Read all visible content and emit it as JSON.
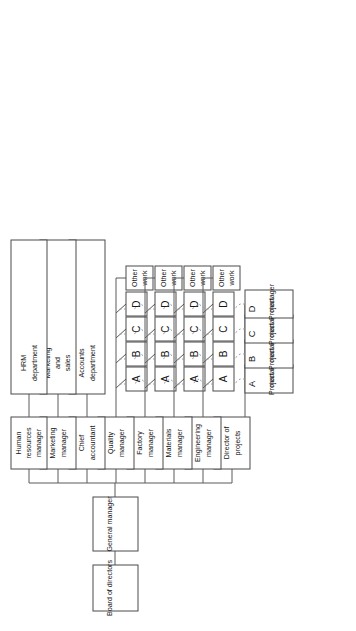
{
  "diagram": {
    "orientation": "rotated-90-clockwise",
    "colors": {
      "box_stroke": "#4a4a4a",
      "box_fill": "#ffffff",
      "line_solid": "#5a5a5a",
      "line_dashed": "#9a9a9a",
      "text": "#141414",
      "background": "#ffffff"
    }
  },
  "top": {
    "board": "Board of directors",
    "general_manager": "General manager"
  },
  "branches": [
    {
      "id": "director-of-projects",
      "label": "Director of\nprojects",
      "line1": "Director of",
      "line2": "projects"
    },
    {
      "id": "engineering-manager",
      "label": "Engineering\nmanager",
      "line1": "Engineering",
      "line2": "manager"
    },
    {
      "id": "materials-manager",
      "label": "Materials\nmanager",
      "line1": "Materials",
      "line2": "manager"
    },
    {
      "id": "factory-manager",
      "label": "Factory\nmanager",
      "line1": "Factory",
      "line2": "manager"
    },
    {
      "id": "quality-manager",
      "label": "Quality\nmanager",
      "line1": "Quality",
      "line2": "manager"
    },
    {
      "id": "chief-accountant",
      "label": "Chief\naccountant",
      "line1": "Chief",
      "line2": "accountant"
    },
    {
      "id": "marketing-manager",
      "label": "Marketing\nmanager",
      "line1": "Marketing",
      "line2": "manager"
    },
    {
      "id": "human-resources-manager",
      "label": "Human\nresources\nmanager",
      "line1": "Human",
      "line2": "resources",
      "line3": "manager"
    }
  ],
  "project_managers": [
    {
      "id": "project-manager-a",
      "role_line1": "Project",
      "role_line2": "manager",
      "letter": "A"
    },
    {
      "id": "project-manager-b",
      "role_line1": "Project",
      "role_line2": "manager",
      "letter": "B"
    },
    {
      "id": "project-manager-c",
      "role_line1": "Project",
      "role_line2": "manager",
      "letter": "C"
    },
    {
      "id": "project-manager-d",
      "role_line1": "Project",
      "role_line2": "manager",
      "letter": "D"
    }
  ],
  "functional_rows": [
    {
      "id": "engineering",
      "manager": "Engineering manager",
      "cells": [
        "A",
        "B",
        "C",
        "D"
      ],
      "other_work_line1": "Other",
      "other_work_line2": "work"
    },
    {
      "id": "materials",
      "manager": "Materials manager",
      "cells": [
        "A",
        "B",
        "C",
        "D"
      ],
      "other_work_line1": "Other",
      "other_work_line2": "work"
    },
    {
      "id": "factory",
      "manager": "Factory manager",
      "cells": [
        "A",
        "B",
        "C",
        "D"
      ],
      "other_work_line1": "Other",
      "other_work_line2": "work"
    },
    {
      "id": "quality",
      "manager": "Quality manager",
      "cells": [
        "A",
        "B",
        "C",
        "D"
      ],
      "other_work_line1": "Other",
      "other_work_line2": "work"
    }
  ],
  "departments": [
    {
      "id": "accounts-department",
      "parent": "Chief accountant",
      "line1": "Accounts",
      "line2": "department"
    },
    {
      "id": "marketing-and-sales",
      "parent": "Marketing manager",
      "line1": "Marketing",
      "line2": "and",
      "line3": "sales"
    },
    {
      "id": "hrm-department",
      "parent": "Human resources manager",
      "line1": "HRM",
      "line2": "department"
    }
  ],
  "cell_labels": {
    "a": "A",
    "b": "B",
    "c": "C",
    "d": "D"
  }
}
